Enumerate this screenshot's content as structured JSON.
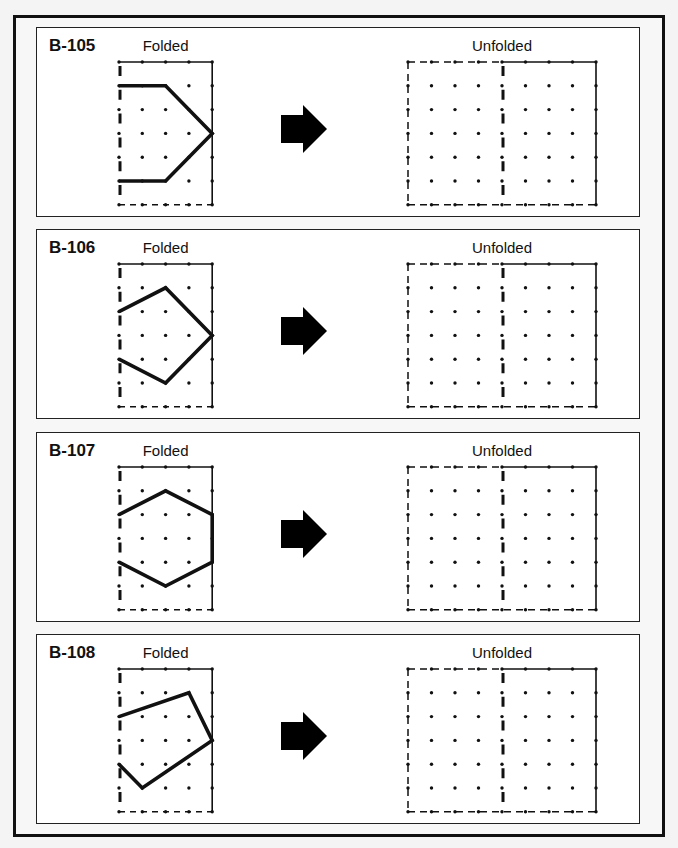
{
  "labels": {
    "folded": "Folded",
    "unfolded": "Unfolded"
  },
  "colors": {
    "ink": "#111111",
    "panel_bg": "#ffffff",
    "frame_bg": "#f7f7f7"
  },
  "grid": {
    "folded": {
      "cols": 5,
      "rows": 7
    },
    "unfolded": {
      "cols": 9,
      "rows": 7,
      "fold_column": 4
    }
  },
  "panels": [
    {
      "id": "B-105",
      "folded_shape": [
        [
          0,
          1
        ],
        [
          2,
          1
        ],
        [
          4,
          3
        ],
        [
          2,
          5
        ],
        [
          0,
          5
        ]
      ]
    },
    {
      "id": "B-106",
      "folded_shape": [
        [
          0,
          2
        ],
        [
          2,
          1
        ],
        [
          4,
          3
        ],
        [
          2,
          5
        ],
        [
          0,
          4
        ]
      ]
    },
    {
      "id": "B-107",
      "folded_shape": [
        [
          0,
          2
        ],
        [
          2,
          1
        ],
        [
          4,
          2
        ],
        [
          4,
          4
        ],
        [
          2,
          5
        ],
        [
          0,
          4
        ]
      ]
    },
    {
      "id": "B-108",
      "folded_shape": [
        [
          0,
          2
        ],
        [
          3,
          1
        ],
        [
          4,
          3
        ],
        [
          1,
          5
        ],
        [
          0,
          4
        ]
      ]
    }
  ],
  "arrow_icon": "right-arrow"
}
